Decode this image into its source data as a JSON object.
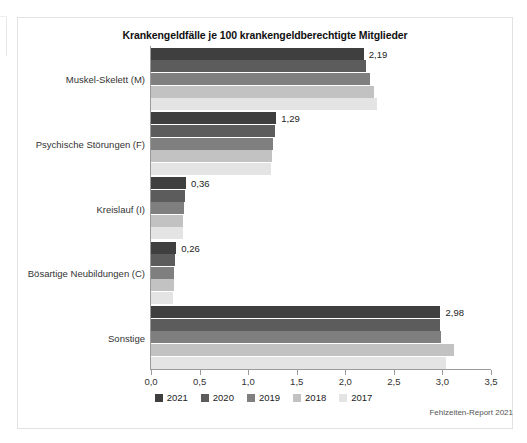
{
  "chart_data": {
    "type": "bar",
    "orientation": "horizontal",
    "title": "Krankengeldfälle je 100 krankengeldberechtigte Mitglieder",
    "xlabel": "",
    "ylabel": "",
    "xlim": [
      0.0,
      3.5
    ],
    "xticks": [
      "0,0",
      "0,5",
      "1,0",
      "1,5",
      "2,0",
      "2,5",
      "3,0",
      "3,5"
    ],
    "xtick_values": [
      0.0,
      0.5,
      1.0,
      1.5,
      2.0,
      2.5,
      3.0,
      3.5
    ],
    "grid": false,
    "legend_position": "bottom",
    "categories": [
      "Muskel-Skelett (M)",
      "Psychische Störungen (F)",
      "Kreislauf (I)",
      "Bösartige Neubildungen (C)",
      "Sonstige"
    ],
    "series": [
      {
        "name": "2021",
        "color": "#3f3f3f",
        "values": [
          2.19,
          1.29,
          0.36,
          0.26,
          2.98
        ]
      },
      {
        "name": "2020",
        "color": "#5c5c5c",
        "values": [
          2.21,
          1.28,
          0.35,
          0.25,
          2.97
        ]
      },
      {
        "name": "2019",
        "color": "#7f7f7f",
        "values": [
          2.25,
          1.26,
          0.34,
          0.24,
          2.99
        ]
      },
      {
        "name": "2018",
        "color": "#c2c2c2",
        "values": [
          2.3,
          1.25,
          0.33,
          0.24,
          3.12
        ]
      },
      {
        "name": "2017",
        "color": "#e4e4e4",
        "values": [
          2.33,
          1.24,
          0.33,
          0.23,
          3.04
        ]
      }
    ],
    "data_labels": [
      "2,19",
      "1,29",
      "0,36",
      "0,26",
      "2,98"
    ],
    "data_label_series": "2021",
    "source": "Fehlzeiten-Report 2021"
  },
  "legend": {
    "items": [
      {
        "label": "2021",
        "color": "#3f3f3f"
      },
      {
        "label": "2020",
        "color": "#5c5c5c"
      },
      {
        "label": "2019",
        "color": "#7f7f7f"
      },
      {
        "label": "2018",
        "color": "#c2c2c2"
      },
      {
        "label": "2017",
        "color": "#e4e4e4"
      }
    ]
  }
}
